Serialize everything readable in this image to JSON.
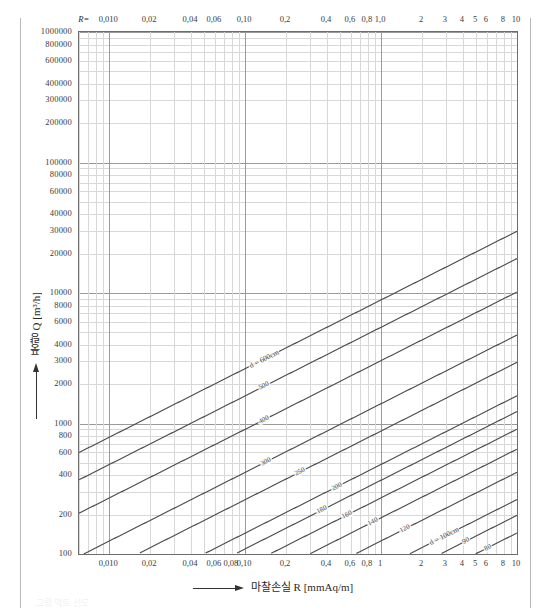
{
  "page": {
    "ghost_caption": "그림 덕트 선도"
  },
  "axes": {
    "x_caption": "마찰손실 R [mmAq/m]",
    "x_caption_symbol": "R",
    "x_caption_unit": "[mmAq/m]",
    "y_caption": "풍량 Q [m³/h]",
    "r_prefix": "R=",
    "x_labels_top": [
      "0,010",
      "0,02",
      "0,04",
      "0,06",
      "0,10",
      "0,2",
      "0,4",
      "0,6",
      "0,8",
      "1,0",
      "2",
      "3",
      "4",
      "5",
      "6",
      "8",
      "10"
    ],
    "x_values_top": [
      0.01,
      0.02,
      0.04,
      0.06,
      0.1,
      0.2,
      0.4,
      0.6,
      0.8,
      1.0,
      2,
      3,
      4,
      5,
      6,
      8,
      10
    ],
    "x_labels_bottom": [
      "0,010",
      "0,02",
      "0,04",
      "0,06",
      "0,08",
      "0,10",
      "0,2",
      "0,4",
      "0,6",
      "0,8",
      "1",
      "2",
      "3",
      "4",
      "5",
      "6",
      "8",
      "10"
    ],
    "x_values_bottom": [
      0.01,
      0.02,
      0.04,
      0.06,
      0.08,
      0.1,
      0.2,
      0.4,
      0.6,
      0.8,
      1,
      2,
      3,
      4,
      5,
      6,
      8,
      10
    ],
    "y_labels": [
      "100",
      "200",
      "400",
      "600",
      "800",
      "1000",
      "2000",
      "3000",
      "4000",
      "6000",
      "8000",
      "10000",
      "20000",
      "30000",
      "40000",
      "60000",
      "80000",
      "100000",
      "200000",
      "300000",
      "400000",
      "600000",
      "800000",
      "1000000"
    ],
    "y_values": [
      100,
      200,
      400,
      600,
      800,
      1000,
      2000,
      3000,
      4000,
      6000,
      8000,
      10000,
      20000,
      30000,
      40000,
      60000,
      80000,
      100000,
      200000,
      300000,
      400000,
      600000,
      800000,
      1000000
    ]
  },
  "chart_data": {
    "type": "line",
    "title": "",
    "subtitle": "",
    "xlabel": "마찰손실 R [mmAq/m]",
    "ylabel": "풍량 Q [m³/h]",
    "xscale": "log",
    "yscale": "log",
    "xlim": [
      0.006,
      10
    ],
    "ylim": [
      100,
      1000000
    ],
    "grid": true,
    "legend": "none",
    "series": [
      {
        "name": "duct-diameter-lines",
        "unit": "cm",
        "label_prefix": "d =",
        "first_label": "d = 600cm",
        "values": [
          600,
          500,
          400,
          300,
          250,
          200,
          180,
          160,
          140,
          120,
          100,
          90,
          80,
          70,
          60,
          50,
          45,
          40,
          35,
          30,
          25,
          20,
          18,
          16,
          14,
          12,
          10,
          9,
          8,
          7,
          6,
          5
        ],
        "labels": [
          "d = 600cm",
          "500",
          "400",
          "300",
          "250",
          "200",
          "180",
          "160",
          "140",
          "120",
          "d = 100cm",
          "90",
          "80",
          "70",
          "60",
          "50",
          "45",
          "40",
          "35",
          "30",
          "25",
          "20",
          "18",
          "16",
          "14",
          "12",
          "10",
          "9",
          "8",
          "7",
          "6",
          "d = 5"
        ]
      },
      {
        "name": "velocity-lines",
        "unit": "m/s",
        "label_prefix": "V =",
        "first_label": "V = 50m/s",
        "values": [
          50,
          40,
          30,
          25,
          20,
          15,
          10,
          8,
          6,
          5,
          4,
          3,
          2,
          1
        ],
        "labels": [
          "V = 50m/s",
          "40",
          "30",
          "25",
          "20",
          "15",
          "10",
          "8",
          "6",
          "5",
          "4,0",
          "3",
          "2,0",
          "1,0"
        ]
      }
    ]
  },
  "annotations": {
    "d_top_left": "d = 600cm",
    "d_mid": "d = 100cm",
    "d_bottom_right": "d = 5",
    "v_top_right": "V = 50m/s",
    "v_right": "V = 50",
    "v_low_left": "1,0",
    "v_low_left2": "2,0",
    "v_low_left3": "3",
    "v_low_left4": "4,0"
  }
}
